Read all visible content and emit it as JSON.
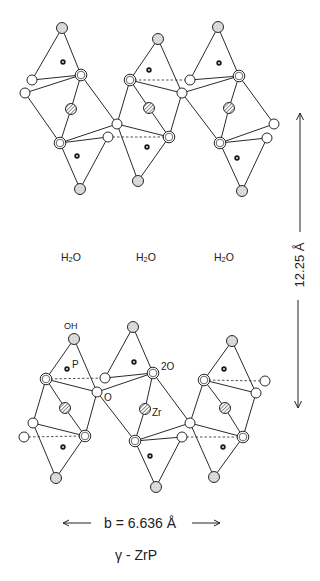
{
  "figure": {
    "title": "γ - ZrP",
    "water_labels": [
      "H2O",
      "H2O",
      "H2O"
    ],
    "interlayer_distance": "12.25 Å",
    "lattice_b": "b = 6.636 Å",
    "atom_labels": {
      "oh": "OH",
      "p": "P",
      "o": "O",
      "two_o": "2O",
      "zr": "Zr"
    },
    "legend_colors": {
      "line": "#2a2a2a",
      "stipple_fill": "#c8c8c8",
      "hatch_fill": "#9a9a9a"
    }
  }
}
